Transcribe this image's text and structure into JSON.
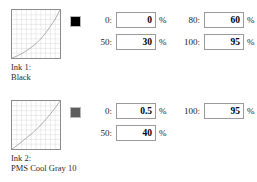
{
  "inks": [
    {
      "swatch_color": "#000000",
      "label_line1": "Ink 1:",
      "label_line2": "Black",
      "curve": {
        "grid_divisions": 10,
        "points": [
          [
            0,
            0
          ],
          [
            10,
            4
          ],
          [
            20,
            9
          ],
          [
            30,
            15
          ],
          [
            40,
            22
          ],
          [
            50,
            30
          ],
          [
            60,
            40
          ],
          [
            70,
            52
          ],
          [
            80,
            66
          ],
          [
            90,
            81
          ],
          [
            100,
            100
          ]
        ]
      },
      "fields_left": [
        {
          "key": "0:",
          "value": "0",
          "unit": "%"
        },
        {
          "key": "50:",
          "value": "30",
          "unit": "%"
        }
      ],
      "fields_right": [
        {
          "key": "80:",
          "value": "60",
          "unit": "%"
        },
        {
          "key": "100:",
          "value": "95",
          "unit": "%"
        }
      ]
    },
    {
      "swatch_color": "#5e5e5e",
      "label_line1": "Ink 2:",
      "label_line2": "PMS Cool Gray 10",
      "curve": {
        "grid_divisions": 10,
        "points": [
          [
            0,
            0
          ],
          [
            10,
            7
          ],
          [
            20,
            15
          ],
          [
            30,
            23
          ],
          [
            40,
            31
          ],
          [
            50,
            40
          ],
          [
            60,
            50
          ],
          [
            70,
            61
          ],
          [
            80,
            73
          ],
          [
            90,
            86
          ],
          [
            100,
            100
          ]
        ]
      },
      "fields_left": [
        {
          "key": "0:",
          "value": "0.5",
          "unit": "%"
        },
        {
          "key": "50:",
          "value": "40",
          "unit": "%"
        }
      ],
      "fields_right": [
        {
          "key": "100:",
          "value": "95",
          "unit": "%"
        }
      ]
    }
  ]
}
